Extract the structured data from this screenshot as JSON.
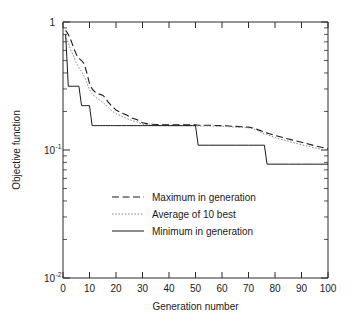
{
  "chart_data": {
    "type": "line",
    "title": "",
    "xlabel": "Generation number",
    "ylabel": "Objective function",
    "xlim": [
      0,
      100
    ],
    "ylim": [
      0.01,
      1
    ],
    "yscale": "log",
    "xscale": "linear",
    "grid": false,
    "legend_position": "center",
    "xticks": [
      "0",
      "10",
      "20",
      "30",
      "40",
      "50",
      "60",
      "70",
      "80",
      "90",
      "100"
    ],
    "xtick_values": [
      0,
      10,
      20,
      30,
      40,
      50,
      60,
      70,
      80,
      90,
      100
    ],
    "yticks": [
      "1",
      "10-1",
      "10-2"
    ],
    "ytick_values": [
      1,
      0.1,
      0.01
    ],
    "ytick_labels": [
      {
        "mantissa": "1",
        "exponent": ""
      },
      {
        "mantissa": "10",
        "exponent": "-1"
      },
      {
        "mantissa": "10",
        "exponent": "-2"
      }
    ],
    "x": [
      1,
      2,
      3,
      4,
      5,
      6,
      7,
      8,
      9,
      10,
      11,
      12,
      13,
      14,
      15,
      16,
      17,
      18,
      19,
      20,
      22,
      24,
      26,
      28,
      30,
      32,
      35,
      40,
      45,
      49,
      50,
      51,
      55,
      60,
      65,
      70,
      72,
      74,
      76,
      77,
      80,
      85,
      90,
      95,
      100
    ],
    "series": [
      {
        "name": "Maximum in generation",
        "style": "dashed",
        "color": "#1a1a1a",
        "values": [
          0.86,
          0.8,
          0.72,
          0.63,
          0.56,
          0.52,
          0.5,
          0.47,
          0.4,
          0.33,
          0.3,
          0.285,
          0.275,
          0.272,
          0.268,
          0.255,
          0.238,
          0.225,
          0.215,
          0.205,
          0.195,
          0.188,
          0.178,
          0.172,
          0.163,
          0.16,
          0.158,
          0.157,
          0.157,
          0.157,
          0.157,
          0.156,
          0.156,
          0.155,
          0.153,
          0.151,
          0.148,
          0.143,
          0.138,
          0.136,
          0.13,
          0.122,
          0.115,
          0.108,
          0.102
        ]
      },
      {
        "name": "Average of 10 best",
        "style": "dotted",
        "color": "#8a8a8a",
        "values": [
          0.75,
          0.69,
          0.6,
          0.54,
          0.48,
          0.44,
          0.41,
          0.375,
          0.335,
          0.295,
          0.275,
          0.262,
          0.252,
          0.244,
          0.236,
          0.226,
          0.216,
          0.206,
          0.198,
          0.192,
          0.184,
          0.176,
          0.17,
          0.165,
          0.159,
          0.157,
          0.156,
          0.155,
          0.155,
          0.155,
          0.155,
          0.154,
          0.154,
          0.153,
          0.151,
          0.149,
          0.146,
          0.14,
          0.134,
          0.132,
          0.125,
          0.117,
          0.11,
          0.104,
          0.099
        ]
      },
      {
        "name": "Minimum in generation",
        "style": "solid",
        "color": "#1a1a1a",
        "values": [
          0.8,
          0.315,
          0.315,
          0.315,
          0.315,
          0.315,
          0.222,
          0.222,
          0.222,
          0.222,
          0.155,
          0.155,
          0.155,
          0.155,
          0.155,
          0.155,
          0.155,
          0.155,
          0.155,
          0.155,
          0.155,
          0.155,
          0.155,
          0.155,
          0.155,
          0.155,
          0.155,
          0.155,
          0.155,
          0.155,
          0.155,
          0.109,
          0.109,
          0.109,
          0.109,
          0.109,
          0.109,
          0.109,
          0.109,
          0.0775,
          0.0775,
          0.0775,
          0.0775,
          0.0775,
          0.0775
        ]
      }
    ],
    "legend": [
      {
        "label": "Maximum in generation",
        "style": "dashed",
        "color": "#1a1a1a"
      },
      {
        "label": "Average of 10 best",
        "style": "dotted",
        "color": "#8a8a8a"
      },
      {
        "label": "Minimum in generation",
        "style": "solid",
        "color": "#1a1a1a"
      }
    ]
  }
}
